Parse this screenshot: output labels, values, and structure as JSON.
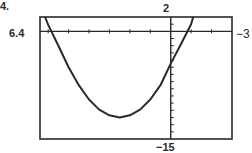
{
  "problem_label": "4.",
  "chart_data": {
    "type": "line",
    "title": "",
    "xlabel": "",
    "ylabel": "",
    "window": {
      "xmin": -6.4,
      "xmax": 3,
      "ymin": -15,
      "ymax": 2
    },
    "window_labels": {
      "left": "6.4",
      "right": "−3",
      "top": "2",
      "bottom": "−15"
    },
    "xlim": [
      -6.4,
      3
    ],
    "ylim": [
      -15,
      2
    ],
    "x_ticks": [
      -6,
      -5,
      -4,
      -3,
      -2,
      -1,
      0,
      1,
      2
    ],
    "y_ticks": [
      -14,
      -13,
      -12,
      -11,
      -10,
      -9,
      -8,
      -7,
      -6,
      -5,
      -4,
      -3,
      -2,
      -1,
      0,
      1
    ],
    "grid": false,
    "series": [
      {
        "name": "parabola",
        "description": "upward-opening parabola, vertex near (-2.5, -12)",
        "x": [
          -6.15,
          -6.0,
          -5.5,
          -5.0,
          -4.5,
          -4.0,
          -3.5,
          -3.0,
          -2.5,
          -2.0,
          -1.5,
          -1.0,
          -0.5,
          0.0,
          0.5,
          1.0,
          1.1
        ],
        "y": [
          2.0,
          0.9,
          -2.0,
          -5.0,
          -7.5,
          -9.5,
          -10.9,
          -11.7,
          -12.0,
          -11.7,
          -10.9,
          -9.5,
          -7.5,
          -4.5,
          -1.8,
          1.0,
          2.0
        ]
      }
    ]
  }
}
